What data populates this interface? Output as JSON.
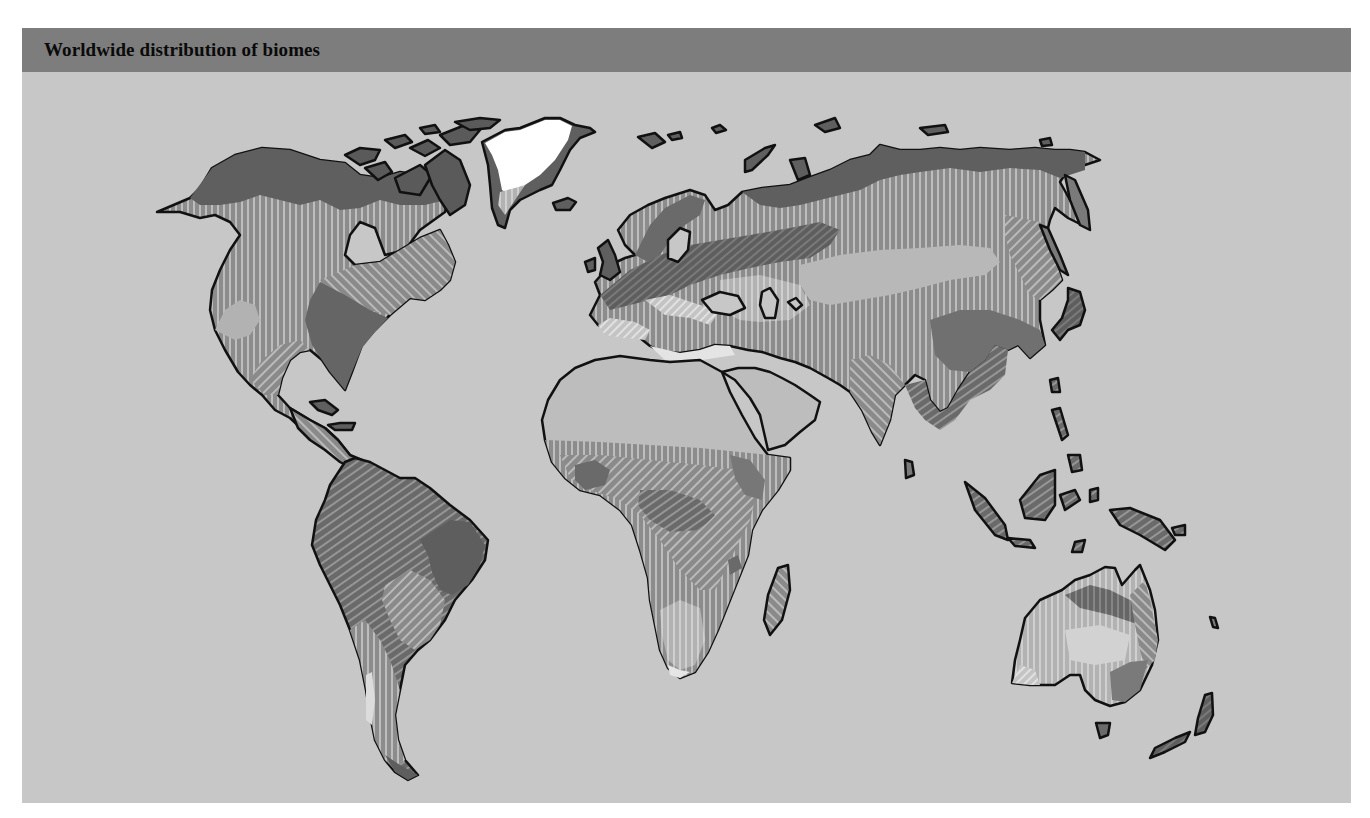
{
  "figure": {
    "title": "Worldwide distribution of biomes"
  },
  "colors": {
    "background": "#ffffff",
    "panel": "#c7c7c7",
    "title_bar": "#7d7d7d",
    "title_text": "#0a0a0a",
    "ocean": "#c7c7c7",
    "coastline": "#111111",
    "ice": "#ffffff",
    "tundra": "#5f5f5f",
    "taiga": "#6e6e6e",
    "temperate_forest": "#707070",
    "grassland": "#a8a8a8",
    "desert": "#bdbdbd",
    "savanna": "#9c9c9c",
    "tropical_forest": "#6a6a6a",
    "chaparral": "#d8d8d8",
    "mountains": "#8a8a8a"
  },
  "map": {
    "projection": "world",
    "style": "grayscale hatched biome regions",
    "continents": [
      {
        "name": "North America"
      },
      {
        "name": "Greenland"
      },
      {
        "name": "South America"
      },
      {
        "name": "Europe"
      },
      {
        "name": "Asia"
      },
      {
        "name": "Africa"
      },
      {
        "name": "Australia"
      },
      {
        "name": "Madagascar"
      },
      {
        "name": "New Zealand"
      },
      {
        "name": "Japan"
      },
      {
        "name": "British Isles"
      },
      {
        "name": "Southeast Asian islands"
      },
      {
        "name": "Canadian Arctic Archipelago"
      },
      {
        "name": "Caribbean islands"
      },
      {
        "name": "Tasmania"
      },
      {
        "name": "Sri Lanka"
      },
      {
        "name": "Svalbard"
      },
      {
        "name": "Novaya Zemlya"
      },
      {
        "name": "Iceland"
      }
    ]
  }
}
